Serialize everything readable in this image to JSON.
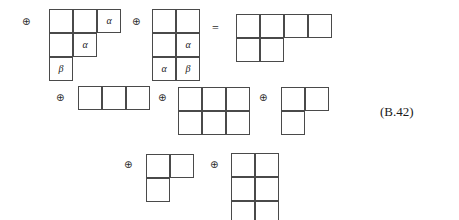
{
  "equation": {
    "tag": "(B.42)",
    "operator_plus": "⊕",
    "operator_equals": "="
  },
  "symbols": {
    "alpha": "α",
    "beta": "β"
  },
  "diagram": {
    "type": "young-tableaux-tensor-decomposition",
    "cell_size": 24,
    "terms": [
      {
        "id": "term-1",
        "role": "left-operand-1",
        "operator_before": "⊕",
        "operator_x": 22,
        "operator_y": 17,
        "x": 49,
        "y": 9,
        "shape": "staircase-3-2-1",
        "row_lengths": [
          3,
          2,
          1
        ],
        "cells": [
          {
            "row": 0,
            "col": 0,
            "label": ""
          },
          {
            "row": 0,
            "col": 1,
            "label": ""
          },
          {
            "row": 0,
            "col": 2,
            "label": "α"
          },
          {
            "row": 1,
            "col": 0,
            "label": ""
          },
          {
            "row": 1,
            "col": 1,
            "label": "α"
          },
          {
            "row": 2,
            "col": 0,
            "label": "β"
          }
        ]
      },
      {
        "id": "term-2",
        "role": "left-operand-2",
        "operator_before": "⊕",
        "operator_x": 132,
        "operator_y": 17,
        "x": 152,
        "y": 9,
        "shape": "rectangle-2x3",
        "row_lengths": [
          2,
          2,
          2
        ],
        "cells": [
          {
            "row": 0,
            "col": 0,
            "label": ""
          },
          {
            "row": 0,
            "col": 1,
            "label": ""
          },
          {
            "row": 1,
            "col": 0,
            "label": ""
          },
          {
            "row": 1,
            "col": 1,
            "label": "α"
          },
          {
            "row": 2,
            "col": 0,
            "label": "α"
          },
          {
            "row": 2,
            "col": 1,
            "label": "β"
          }
        ]
      },
      {
        "id": "term-3",
        "role": "result-1",
        "operator_before": "=",
        "operator_x": 212,
        "operator_y": 22,
        "x": 236,
        "y": 14,
        "shape": "hook-4-2",
        "row_lengths": [
          4,
          2
        ],
        "cells": [
          {
            "row": 0,
            "col": 0,
            "label": ""
          },
          {
            "row": 0,
            "col": 1,
            "label": ""
          },
          {
            "row": 0,
            "col": 2,
            "label": ""
          },
          {
            "row": 0,
            "col": 3,
            "label": ""
          },
          {
            "row": 1,
            "col": 0,
            "label": ""
          },
          {
            "row": 1,
            "col": 1,
            "label": ""
          }
        ]
      },
      {
        "id": "term-4",
        "role": "result-2",
        "operator_before": "⊕",
        "operator_x": 56,
        "operator_y": 93,
        "x": 78,
        "y": 86,
        "shape": "row-3",
        "row_lengths": [
          3
        ],
        "cells": [
          {
            "row": 0,
            "col": 0,
            "label": ""
          },
          {
            "row": 0,
            "col": 1,
            "label": ""
          },
          {
            "row": 0,
            "col": 2,
            "label": ""
          }
        ]
      },
      {
        "id": "term-5",
        "role": "result-3",
        "operator_before": "⊕",
        "operator_x": 158,
        "operator_y": 93,
        "x": 178,
        "y": 87,
        "shape": "rectangle-3x2",
        "row_lengths": [
          3,
          3
        ],
        "cells": [
          {
            "row": 0,
            "col": 0,
            "label": ""
          },
          {
            "row": 0,
            "col": 1,
            "label": ""
          },
          {
            "row": 0,
            "col": 2,
            "label": ""
          },
          {
            "row": 1,
            "col": 0,
            "label": ""
          },
          {
            "row": 1,
            "col": 1,
            "label": ""
          },
          {
            "row": 1,
            "col": 2,
            "label": ""
          }
        ]
      },
      {
        "id": "term-6",
        "role": "result-4",
        "operator_before": "⊕",
        "operator_x": 259,
        "operator_y": 93,
        "x": 281,
        "y": 87,
        "shape": "L-2-1",
        "row_lengths": [
          2,
          1
        ],
        "cells": [
          {
            "row": 0,
            "col": 0,
            "label": ""
          },
          {
            "row": 0,
            "col": 1,
            "label": ""
          },
          {
            "row": 1,
            "col": 0,
            "label": ""
          }
        ]
      },
      {
        "id": "term-7",
        "role": "result-5",
        "operator_before": "⊕",
        "operator_x": 124,
        "operator_y": 160,
        "x": 146,
        "y": 154,
        "shape": "L-2-1",
        "row_lengths": [
          2,
          1
        ],
        "cells": [
          {
            "row": 0,
            "col": 0,
            "label": ""
          },
          {
            "row": 0,
            "col": 1,
            "label": ""
          },
          {
            "row": 1,
            "col": 0,
            "label": ""
          }
        ]
      },
      {
        "id": "term-8",
        "role": "result-6",
        "operator_before": "⊕",
        "operator_x": 210,
        "operator_y": 160,
        "x": 231,
        "y": 153,
        "shape": "rectangle-2x3",
        "row_lengths": [
          2,
          2,
          2
        ],
        "cells": [
          {
            "row": 0,
            "col": 0,
            "label": ""
          },
          {
            "row": 0,
            "col": 1,
            "label": ""
          },
          {
            "row": 1,
            "col": 0,
            "label": ""
          },
          {
            "row": 1,
            "col": 1,
            "label": ""
          },
          {
            "row": 2,
            "col": 0,
            "label": ""
          },
          {
            "row": 2,
            "col": 1,
            "label": ""
          }
        ]
      }
    ],
    "tag_position": {
      "x": 380,
      "y": 105
    }
  }
}
